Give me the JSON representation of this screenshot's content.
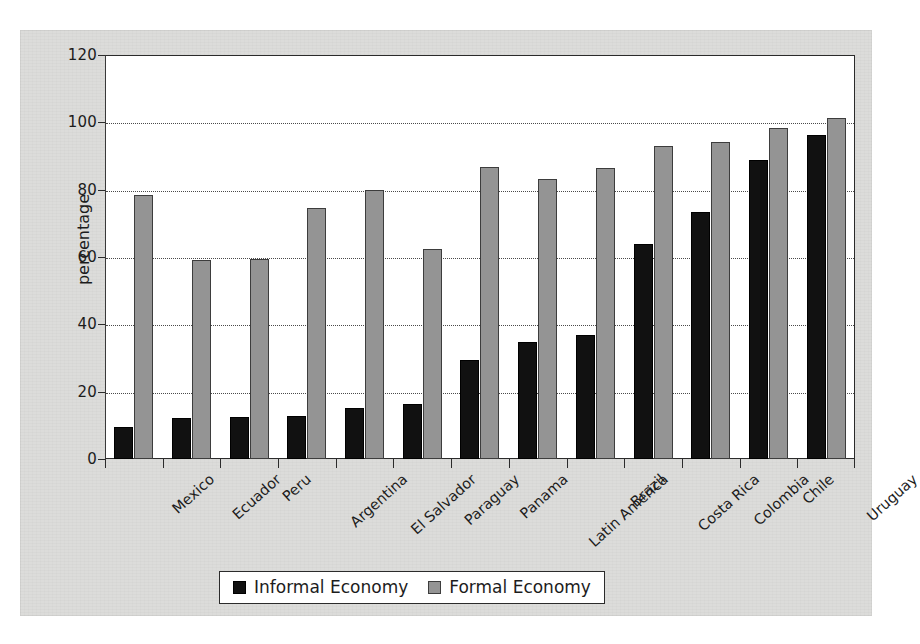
{
  "chart_data": {
    "type": "bar",
    "title": "",
    "xlabel": "",
    "ylabel": "percentage",
    "ylim": [
      0,
      120
    ],
    "ytick_values": [
      0,
      20,
      40,
      60,
      80,
      100,
      120
    ],
    "ytick_labels": [
      "0",
      "20",
      "40",
      "60",
      "80",
      "100",
      "120"
    ],
    "grid": true,
    "grid_style": "dotted-horizontal",
    "legend_position": "bottom-center",
    "categories": [
      "Mexico",
      "Ecuador",
      "Peru",
      "Argentina",
      "El Salvador",
      "Paraguay",
      "Panama",
      "Latin America",
      "Brazil",
      "Costa Rica",
      "Colombia",
      "Chile",
      "Uruguay"
    ],
    "series": [
      {
        "name": "Informal Economy",
        "color": "#111111",
        "values": [
          9.5,
          12.2,
          12.5,
          12.8,
          15.3,
          16.3,
          29.3,
          34.8,
          36.8,
          63.8,
          73.3,
          88.8,
          96.3
        ]
      },
      {
        "name": "Formal Economy",
        "color": "#949494",
        "values": [
          78.3,
          59.2,
          59.3,
          74.5,
          79.8,
          62.5,
          86.8,
          83.3,
          86.3,
          93.0,
          94.3,
          98.3,
          101.3
        ]
      }
    ]
  },
  "axis": {
    "y_title": "percentage"
  },
  "legend": {
    "entries": [
      {
        "label": "Informal Economy"
      },
      {
        "label": "Formal Economy"
      }
    ]
  }
}
